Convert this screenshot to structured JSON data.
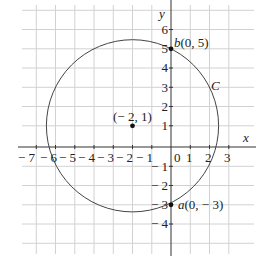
{
  "figure": {
    "axes": {
      "x_label": "x",
      "y_label": "y",
      "x_ticks": [
        "− 7",
        "− 6",
        "− 5",
        "− 4",
        "− 3",
        "− 2",
        "− 1",
        "0",
        "1",
        "2",
        "3"
      ],
      "y_ticks": [
        "6",
        "5",
        "4",
        "3",
        "2",
        "1",
        "− 1",
        "− 2",
        "− 3",
        "− 4"
      ],
      "x_range": [
        -8,
        4
      ],
      "y_range": [
        -5,
        7
      ]
    },
    "circle": {
      "label": "C",
      "center": [
        -2,
        1
      ],
      "radius": 4.472
    },
    "points": [
      {
        "name": "b",
        "coords": "(0, 5)",
        "label_prefix": "b",
        "label_suffix": "(0, 5)",
        "x": 0,
        "y": 5
      },
      {
        "name": "a",
        "coords": "(0, − 3)",
        "label_prefix": "a",
        "label_suffix": "(0, − 3)",
        "x": 0,
        "y": -3
      },
      {
        "name": "center",
        "label": "(− 2, 1)",
        "x": -2,
        "y": 1
      }
    ],
    "colors": {
      "grid": "#d2d2d2",
      "axis": "#333333",
      "curve": "#444444",
      "point": "#111111"
    }
  }
}
